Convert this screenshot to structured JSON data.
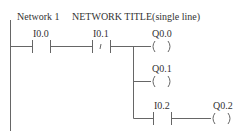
{
  "network": {
    "label": "Network 1",
    "title": "NETWORK TITLE(single line)"
  },
  "rungs": {
    "main": {
      "contact1": {
        "address": "I0.0",
        "type": "normally-open"
      },
      "contact2": {
        "address": "I0.1",
        "type": "normally-closed",
        "symbol": "/"
      },
      "coil": {
        "address": "Q0.0",
        "symbol": "(    )"
      }
    },
    "branch1": {
      "coil": {
        "address": "Q0.1",
        "symbol": "(    )"
      }
    },
    "branch2": {
      "contact": {
        "address": "I0.2",
        "type": "normally-open"
      },
      "coil": {
        "address": "Q0.2",
        "symbol": "(    )"
      }
    }
  },
  "colors": {
    "line": "#555555",
    "text": "#333333",
    "background": "#ffffff"
  }
}
